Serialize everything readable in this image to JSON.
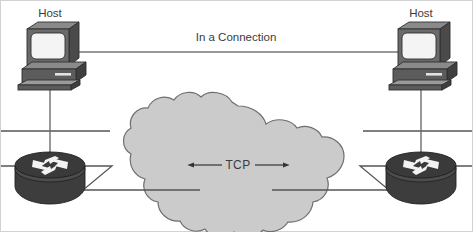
{
  "diagram": {
    "title_visible": false,
    "width": 473,
    "height": 232,
    "background_color": "#ffffff",
    "border_color": "#cfcfcf"
  },
  "labels": {
    "host_left": "Host",
    "host_right": "Host",
    "connection": "In a Connection",
    "tcp": "TCP"
  },
  "colors": {
    "cloud_fill": "#cbcbcb",
    "cloud_stroke": "#6e6e6e",
    "line": "#555555",
    "device_dark": "#3a3a3a",
    "device_mid": "#5a5a5a",
    "device_light": "#8a8a8a",
    "screen_fill": "#f2f2f2",
    "text": "#3b3b3b",
    "arrow": "#333333"
  },
  "nodes": [
    {
      "id": "host-left",
      "type": "workstation",
      "label": "Host",
      "x": 50,
      "y": 60
    },
    {
      "id": "host-right",
      "type": "workstation",
      "label": "Host",
      "x": 421,
      "y": 60
    },
    {
      "id": "router-left",
      "type": "router",
      "label": "",
      "x": 50,
      "y": 170
    },
    {
      "id": "router-right",
      "type": "router",
      "label": "",
      "x": 421,
      "y": 170
    },
    {
      "id": "cloud",
      "type": "cloud",
      "label": "TCP",
      "x": 238,
      "y": 172
    }
  ],
  "links": [
    {
      "id": "connection-arrow",
      "from": "host-left",
      "to": "host-right",
      "label": "In a Connection",
      "style": "double-arrow",
      "y": 52
    },
    {
      "id": "tcp-arrow",
      "from": "cloud-west",
      "to": "cloud-east",
      "label": "TCP",
      "style": "double-arrow",
      "y": 165
    },
    {
      "id": "lan-left",
      "from": "host-left",
      "to": "router-left",
      "label": "",
      "style": "ethernet-bus"
    },
    {
      "id": "lan-right",
      "from": "host-right",
      "to": "router-right",
      "label": "",
      "style": "ethernet-bus"
    },
    {
      "id": "serial-left",
      "from": "router-left",
      "to": "cloud",
      "label": "",
      "style": "serial-zigzag"
    },
    {
      "id": "serial-right",
      "from": "router-right",
      "to": "cloud",
      "label": "",
      "style": "serial-zigzag"
    }
  ]
}
